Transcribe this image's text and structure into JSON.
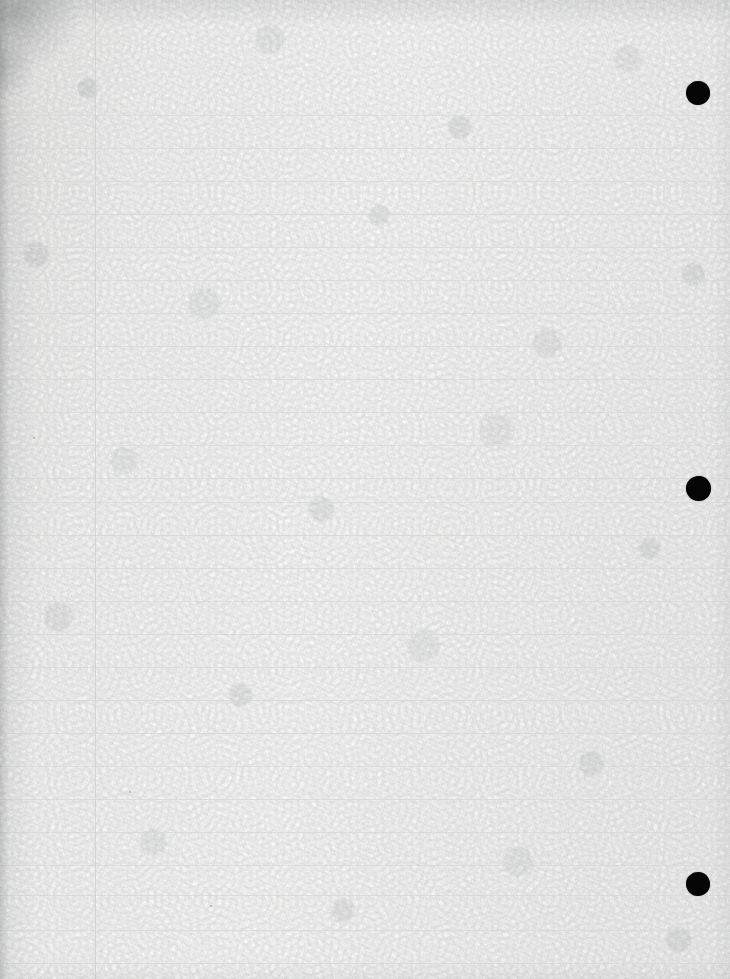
{
  "document": {
    "kind": "scanned-page",
    "title": "Scanned lined notebook page",
    "content_text": "",
    "is_blank": true,
    "page_width": 730,
    "page_height": 979
  },
  "paper": {
    "base_color": "#f6f6f5",
    "highlight_color": "#fafaf9",
    "shadow_color": "#ececea",
    "texture": "mottled fibrous recycled paper"
  },
  "ruling": {
    "style": "wide-ruled notebook paper",
    "line_color": "#d6d9d8",
    "margin_line_color": "#cfd2d3",
    "line_spacing": 33,
    "first_line_y": 115,
    "margin_line_x": 95,
    "horizontal_lines_y": [
      115,
      148,
      181,
      214,
      247,
      280,
      313,
      346,
      379,
      412,
      445,
      478,
      502,
      535,
      568,
      601,
      634,
      667,
      700,
      733,
      766,
      799,
      832,
      865,
      895,
      930,
      963
    ]
  },
  "marks": {
    "label": "registration marks",
    "color": "#050505",
    "dots": [
      {
        "id": "mark-1",
        "cx": 698,
        "cy": 93,
        "d": 24
      },
      {
        "id": "mark-2",
        "cx": 698,
        "cy": 488,
        "d": 25
      },
      {
        "id": "mark-3",
        "cx": 698,
        "cy": 884,
        "d": 24
      }
    ]
  },
  "specks": [
    {
      "x": 33,
      "y": 437,
      "s": 2
    },
    {
      "x": 129,
      "y": 791,
      "s": 2
    },
    {
      "x": 372,
      "y": 611,
      "s": 1
    },
    {
      "x": 596,
      "y": 268,
      "s": 1
    },
    {
      "x": 210,
      "y": 905,
      "s": 2
    },
    {
      "x": 481,
      "y": 142,
      "s": 1
    }
  ]
}
